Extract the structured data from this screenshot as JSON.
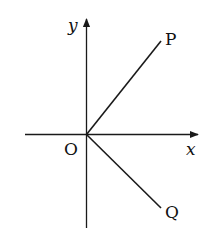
{
  "diagram": {
    "axes": {
      "x_label": "x",
      "y_label": "y",
      "origin_label": "O"
    },
    "rays": [
      {
        "label": "P",
        "direction": "upper-right"
      },
      {
        "label": "Q",
        "direction": "lower-right"
      }
    ],
    "colors": {
      "line": "#1a1a1a",
      "background": "#ffffff"
    }
  }
}
